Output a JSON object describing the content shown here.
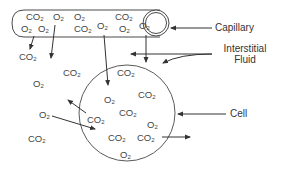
{
  "labels": {
    "capillary": "Capillary",
    "interstitial_line1": "Interstitial",
    "interstitial_line2": "Fluid",
    "cell": "Cell"
  },
  "molecules": {
    "capillary": [
      {
        "base": "CO",
        "sub": "2",
        "x": 26,
        "y": 12
      },
      {
        "base": "O",
        "sub": "2",
        "x": 53,
        "y": 12
      },
      {
        "base": "O",
        "sub": "2",
        "x": 74,
        "y": 12
      },
      {
        "base": "O",
        "sub": "2",
        "x": 21,
        "y": 24
      },
      {
        "base": "O",
        "sub": "2",
        "x": 38,
        "y": 24
      },
      {
        "base": "CO",
        "sub": "2",
        "x": 74,
        "y": 24
      },
      {
        "base": "O",
        "sub": "2",
        "x": 97,
        "y": 21
      },
      {
        "base": "CO",
        "sub": "2",
        "x": 115,
        "y": 12
      },
      {
        "base": "O",
        "sub": "2",
        "x": 119,
        "y": 24
      },
      {
        "base": "O",
        "sub": "2",
        "x": 139,
        "y": 21
      }
    ],
    "interstitial": [
      {
        "base": "CO",
        "sub": "2",
        "x": 19,
        "y": 52
      },
      {
        "base": "CO",
        "sub": "2",
        "x": 63,
        "y": 68
      },
      {
        "base": "O",
        "sub": "2",
        "x": 33,
        "y": 79
      },
      {
        "base": "O",
        "sub": "2",
        "x": 39,
        "y": 110
      },
      {
        "base": "CO",
        "sub": "2",
        "x": 28,
        "y": 134
      }
    ],
    "cell": [
      {
        "base": "CO",
        "sub": "2",
        "x": 117,
        "y": 68
      },
      {
        "base": "O",
        "sub": "2",
        "x": 104,
        "y": 95
      },
      {
        "base": "CO",
        "sub": "2",
        "x": 138,
        "y": 90
      },
      {
        "base": "CO",
        "sub": "2",
        "x": 119,
        "y": 108
      },
      {
        "base": "O",
        "sub": "2",
        "x": 147,
        "y": 120
      },
      {
        "base": "CO",
        "sub": "2",
        "x": 87,
        "y": 115
      },
      {
        "base": "CO",
        "sub": "2",
        "x": 108,
        "y": 133
      },
      {
        "base": "CO",
        "sub": "2",
        "x": 137,
        "y": 133
      },
      {
        "base": "O",
        "sub": "2",
        "x": 120,
        "y": 150
      }
    ]
  },
  "colors": {
    "line": "#4a4a4a",
    "text": "#333333",
    "background": "#ffffff"
  }
}
